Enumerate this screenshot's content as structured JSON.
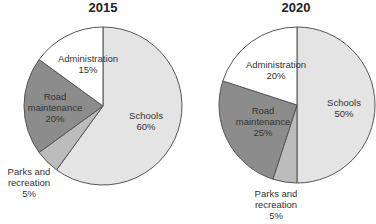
{
  "chart_data": [
    {
      "type": "pie",
      "title": "2015",
      "start_angle": "12 o'clock, clockwise",
      "slices": [
        {
          "label": "Schools",
          "value": 60,
          "display": "60%",
          "color": "#e4e4e4"
        },
        {
          "label": "Parks and recreation",
          "value": 5,
          "display": "5%",
          "color": "#bcbcbc"
        },
        {
          "label": "Road maintenance",
          "value": 20,
          "display": "20%",
          "color": "#8c8c8c"
        },
        {
          "label": "Administration",
          "value": 15,
          "display": "15%",
          "color": "#ffffff"
        }
      ]
    },
    {
      "type": "pie",
      "title": "2020",
      "start_angle": "12 o'clock, clockwise",
      "slices": [
        {
          "label": "Schools",
          "value": 50,
          "display": "50%",
          "color": "#e4e4e4"
        },
        {
          "label": "Parks and recreation",
          "value": 5,
          "display": "5%",
          "color": "#bcbcbc"
        },
        {
          "label": "Road maintenance",
          "value": 25,
          "display": "25%",
          "color": "#8c8c8c"
        },
        {
          "label": "Administration",
          "value": 20,
          "display": "20%",
          "color": "#ffffff"
        }
      ]
    }
  ],
  "labels": {
    "c2015": {
      "schools": [
        "Schools",
        "60%"
      ],
      "parks": [
        "Parks and",
        "recreation",
        "5%"
      ],
      "road": [
        "Road",
        "maintenance",
        "20%"
      ],
      "admin": [
        "Administration",
        "15%"
      ]
    },
    "c2020": {
      "schools": [
        "Schools",
        "50%"
      ],
      "parks": [
        "Parks and",
        "recreation",
        "5%"
      ],
      "road": [
        "Road",
        "maintenance",
        "25%"
      ],
      "admin": [
        "Administration",
        "20%"
      ]
    }
  }
}
